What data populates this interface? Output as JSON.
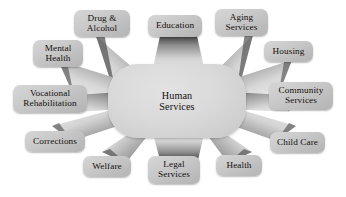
{
  "diagram": {
    "title": "Human Services",
    "type": "radial hub-and-spoke",
    "hub": {
      "label": "Human\nServices",
      "x": 108,
      "y": 64,
      "w": 138,
      "h": 74
    },
    "colors": {
      "background": "#ffffff",
      "hub_fill": "#d8d8d8",
      "node_fill": "#c9c9c9",
      "spoke_dark": "#4a4a4a",
      "spoke_light": "#e8e8e8",
      "text": "#14100e"
    },
    "nodes": [
      {
        "id": "drug-alcohol",
        "label": "Drug &\nAlcohol",
        "x": 74,
        "y": 10,
        "w": 56,
        "h": 27
      },
      {
        "id": "education",
        "label": "Education",
        "x": 148,
        "y": 15,
        "w": 54,
        "h": 22
      },
      {
        "id": "aging-services",
        "label": "Aging\nServices",
        "x": 215,
        "y": 9,
        "w": 53,
        "h": 27
      },
      {
        "id": "mental-health",
        "label": "Mental\nHealth",
        "x": 33,
        "y": 40,
        "w": 50,
        "h": 27
      },
      {
        "id": "housing",
        "label": "Housing",
        "x": 264,
        "y": 41,
        "w": 49,
        "h": 21
      },
      {
        "id": "vocational-rehabilitation",
        "label": "Vocational\nRehabilitation",
        "x": 13,
        "y": 85,
        "w": 74,
        "h": 28
      },
      {
        "id": "community-services",
        "label": "Community\nServices",
        "x": 269,
        "y": 82,
        "w": 64,
        "h": 28
      },
      {
        "id": "child-care",
        "label": "Child Care",
        "x": 270,
        "y": 132,
        "w": 55,
        "h": 21
      },
      {
        "id": "corrections",
        "label": "Corrections",
        "x": 25,
        "y": 131,
        "w": 60,
        "h": 21
      },
      {
        "id": "welfare",
        "label": "Welfare",
        "x": 83,
        "y": 156,
        "w": 48,
        "h": 21
      },
      {
        "id": "legal-services",
        "label": "Legal\nServices",
        "x": 148,
        "y": 156,
        "w": 52,
        "h": 28
      },
      {
        "id": "health",
        "label": "Health",
        "x": 216,
        "y": 155,
        "w": 46,
        "h": 21
      }
    ],
    "spokes": [
      {
        "id": "spoke-drug-alcohol",
        "target": "drug-alcohol"
      },
      {
        "id": "spoke-education",
        "target": "education"
      },
      {
        "id": "spoke-aging-services",
        "target": "aging-services"
      },
      {
        "id": "spoke-mental-health",
        "target": "mental-health"
      },
      {
        "id": "spoke-housing",
        "target": "housing"
      },
      {
        "id": "spoke-vocational-rehabilitation",
        "target": "vocational-rehabilitation"
      },
      {
        "id": "spoke-community-services",
        "target": "community-services"
      },
      {
        "id": "spoke-child-care",
        "target": "child-care"
      },
      {
        "id": "spoke-corrections",
        "target": "corrections"
      },
      {
        "id": "spoke-welfare",
        "target": "welfare"
      },
      {
        "id": "spoke-legal-services",
        "target": "legal-services"
      },
      {
        "id": "spoke-health",
        "target": "health"
      }
    ]
  }
}
